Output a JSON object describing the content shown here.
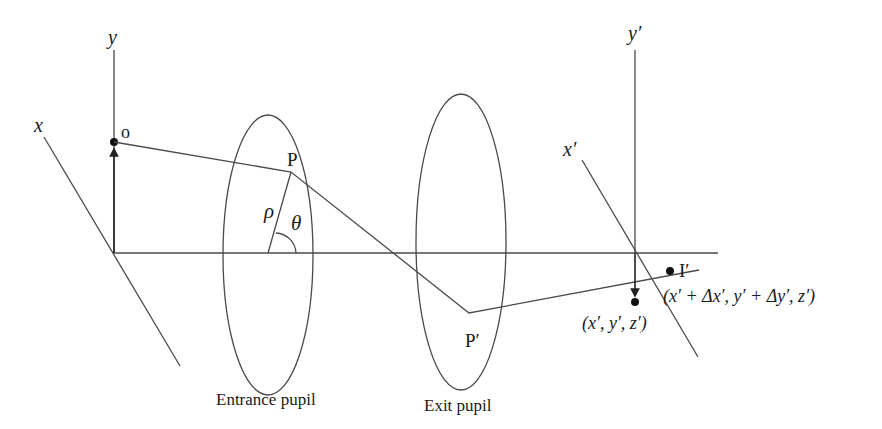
{
  "diagram": {
    "object_space": {
      "y_axis_label": "y",
      "x_axis_label": "x",
      "object_point_label": "o"
    },
    "entrance_pupil": {
      "label": "Entrance pupil",
      "point_label": "P",
      "radius_label": "ρ",
      "angle_label": "θ"
    },
    "exit_pupil": {
      "label": "Exit pupil",
      "point_label": "P′"
    },
    "image_space": {
      "y_axis_label": "y′",
      "x_axis_label": "x′",
      "image_point_label": "I′",
      "image_point_coords": "(x′ + Δx′, y′ + Δy′, z′)",
      "ideal_point_coords": "(x′, y′, z′)"
    }
  }
}
